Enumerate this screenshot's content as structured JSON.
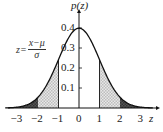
{
  "chart_data": {
    "type": "area",
    "title": "",
    "xlabel": "z",
    "ylabel": "p(z)",
    "formula": {
      "lhs": "z=",
      "numerator": "x−μ",
      "denominator": "σ"
    },
    "xlim": [
      -3.6,
      3.6
    ],
    "ylim": [
      0,
      0.42
    ],
    "x_ticks": [
      -3,
      -2,
      -1,
      0,
      1,
      2,
      3
    ],
    "x_tick_labels": [
      "−3",
      "−2",
      "−1",
      "0",
      "1",
      "2",
      "3"
    ],
    "y_ticks": [
      0.1,
      0.2,
      0.3,
      0.4
    ],
    "y_tick_labels": [
      "0.1",
      "0.2",
      "0.3",
      "0.4"
    ],
    "curve": "standard normal density p(z) = exp(-z^2/2)/sqrt(2π)",
    "x": [
      -3.5,
      -3,
      -2.5,
      -2,
      -1.5,
      -1,
      -0.5,
      0,
      0.5,
      1,
      1.5,
      2,
      2.5,
      3,
      3.5
    ],
    "values": [
      0.0009,
      0.0044,
      0.0175,
      0.054,
      0.1295,
      0.242,
      0.3521,
      0.3989,
      0.3521,
      0.242,
      0.1295,
      0.054,
      0.0175,
      0.0044,
      0.0009
    ],
    "shaded_regions": [
      {
        "from": -3.6,
        "to": -2,
        "style": "dark"
      },
      {
        "from": -2,
        "to": -1,
        "style": "light-checkered"
      },
      {
        "from": 1,
        "to": 2,
        "style": "light-checkered"
      },
      {
        "from": 2,
        "to": 3.6,
        "style": "dark"
      }
    ],
    "vertical_lines_at": [
      -1,
      1
    ],
    "grid": false,
    "legend": null
  },
  "labels": {
    "ylabel": "p(z)",
    "xlabel": "z",
    "formula_lhs": "z=",
    "formula_num": "x−μ",
    "formula_den": "σ"
  }
}
